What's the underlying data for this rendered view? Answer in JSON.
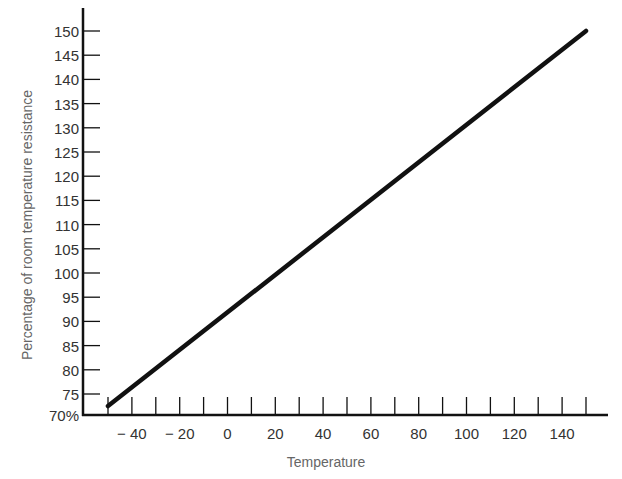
{
  "chart_data": {
    "type": "line",
    "title": "",
    "xlabel": "Temperature",
    "ylabel": "Percentage of room temperature resistance",
    "x_tick_labels": [
      "-40",
      "-20",
      "0",
      "20",
      "40",
      "60",
      "80",
      "100",
      "120",
      "140"
    ],
    "x_tick_values": [
      -50,
      -40,
      -30,
      -20,
      -10,
      0,
      10,
      20,
      30,
      40,
      50,
      60,
      70,
      80,
      90,
      100,
      110,
      120,
      130,
      140,
      150
    ],
    "y_tick_labels": [
      "70%",
      "75",
      "80",
      "85",
      "90",
      "95",
      "100",
      "105",
      "110",
      "115",
      "120",
      "125",
      "130",
      "135",
      "140",
      "145",
      "150"
    ],
    "y_tick_values": [
      70,
      75,
      80,
      85,
      90,
      95,
      100,
      105,
      110,
      115,
      120,
      125,
      130,
      135,
      140,
      145,
      150
    ],
    "xlim": [
      -50,
      155
    ],
    "ylim": [
      70,
      150
    ],
    "grid": false,
    "legend": null,
    "series": [
      {
        "name": "Resistance",
        "x": [
          -50,
          150
        ],
        "y": [
          72.5,
          150
        ],
        "color": "#111111"
      }
    ]
  }
}
